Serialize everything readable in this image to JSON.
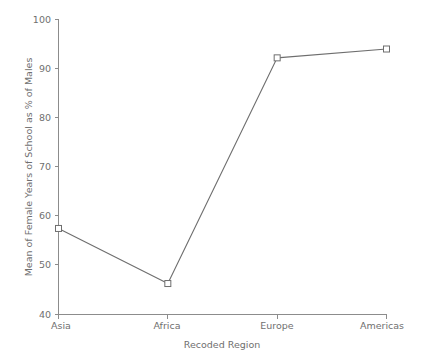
{
  "chart_data": {
    "type": "line",
    "title": "",
    "xlabel": "Recoded Region",
    "ylabel": "Mean of Female Years of School as % of Males",
    "categories": [
      "Asia",
      "Africa",
      "Europe",
      "Americas"
    ],
    "values": [
      57.5,
      46.3,
      92.2,
      94.0
    ],
    "series": [
      {
        "name": "Mean of Female Years of School as % of Males",
        "values": [
          57.5,
          46.3,
          92.2,
          94.0
        ]
      }
    ],
    "ylim": [
      40,
      100
    ],
    "yticks": [
      40,
      50,
      60,
      70,
      80,
      90,
      100
    ],
    "ytick_labels": [
      "40",
      "50",
      "60",
      "70",
      "80",
      "90",
      "100"
    ],
    "xtick_labels": [
      "Asia",
      "Africa",
      "Europe",
      "Americas"
    ],
    "grid": false,
    "legend": "none",
    "marker": "open-square",
    "line_color": "#6e6e6e",
    "marker_color": "#6e6e6e",
    "axis_color": "#8c8c8c",
    "text_color": "#6f6f6f",
    "background_color": "#ffffff"
  },
  "axis": {
    "y_title": "Mean of Female Years of School as % of Males",
    "x_title": "Recoded Region",
    "y_ticks": [
      "100",
      "90",
      "80",
      "70",
      "60",
      "50",
      "40"
    ],
    "x_ticks": [
      "Asia",
      "Africa",
      "Europe",
      "Americas"
    ]
  }
}
